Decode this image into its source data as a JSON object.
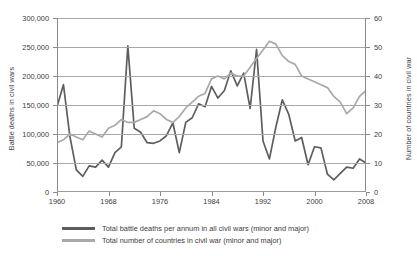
{
  "chart_data": {
    "type": "line",
    "title": "",
    "xlabel": "",
    "ylabel": "Battle deaths in civil wars",
    "y2label": "Number of countries in civil war",
    "grid": true,
    "legend_position": "bottom",
    "xlim": [
      1960,
      2008
    ],
    "ylim": [
      0,
      300000
    ],
    "y2lim": [
      0,
      60
    ],
    "xticks": [
      1960,
      1968,
      1976,
      1984,
      1992,
      2000,
      2008
    ],
    "xtick_labels": [
      "1960",
      "1968",
      "1976",
      "1984",
      "1992",
      "2000",
      "2008"
    ],
    "yticks": [
      0,
      50000,
      100000,
      150000,
      200000,
      250000,
      300000
    ],
    "ytick_labels": [
      "0",
      "50,000",
      "100,000",
      "150,000",
      "200,000",
      "250,000",
      "300,000"
    ],
    "y2ticks": [
      0,
      10,
      20,
      30,
      40,
      50,
      60
    ],
    "y2tick_labels": [
      "0",
      "10",
      "20",
      "30",
      "40",
      "50",
      "60"
    ],
    "x": [
      1960,
      1961,
      1962,
      1963,
      1964,
      1965,
      1966,
      1967,
      1968,
      1969,
      1970,
      1971,
      1972,
      1973,
      1974,
      1975,
      1976,
      1977,
      1978,
      1979,
      1980,
      1981,
      1982,
      1983,
      1984,
      1985,
      1986,
      1987,
      1988,
      1989,
      1990,
      1991,
      1992,
      1993,
      1994,
      1995,
      1996,
      1997,
      1998,
      1999,
      2000,
      2001,
      2002,
      2003,
      2004,
      2005,
      2006,
      2007,
      2008
    ],
    "series": [
      {
        "name": "Total battle deaths per annum in all civil wars (minor and major)",
        "axis": "left",
        "color": "#5e5e5e",
        "values": [
          147000,
          185000,
          96000,
          38000,
          27000,
          45000,
          43000,
          55000,
          43000,
          68000,
          78000,
          252000,
          110000,
          103000,
          85000,
          84000,
          88000,
          97000,
          119000,
          68000,
          120000,
          128000,
          152000,
          147000,
          182000,
          162000,
          175000,
          209000,
          183000,
          205000,
          144000,
          246000,
          88000,
          57000,
          112000,
          159000,
          134000,
          88000,
          94000,
          47000,
          78000,
          76000,
          31000,
          21000,
          32000,
          43000,
          41000,
          57000,
          50000
        ]
      },
      {
        "name": "Total number of countries in civil war (minor and major)",
        "axis": "right",
        "color": "#a9a9a9",
        "values": [
          17,
          18,
          20,
          19,
          18,
          21,
          20,
          19,
          22,
          23,
          25,
          24,
          24,
          25,
          26,
          28,
          27,
          25,
          24,
          26,
          29,
          31,
          33,
          34,
          39,
          40,
          39,
          41,
          40,
          40,
          43,
          46,
          49,
          52,
          51,
          47,
          45,
          44,
          40,
          39,
          38,
          37,
          36,
          33,
          31,
          27,
          29,
          33,
          35
        ]
      }
    ]
  },
  "legend": {
    "items": [
      {
        "label": "Total battle deaths per annum in all civil wars (minor and major)",
        "color": "#5e5e5e"
      },
      {
        "label": "Total number of countries in civil war (minor and major)",
        "color": "#a9a9a9"
      }
    ]
  },
  "axes": {
    "y_left_title": "Battle deaths in civil wars",
    "y_right_title": "Number of countries in civil war"
  }
}
